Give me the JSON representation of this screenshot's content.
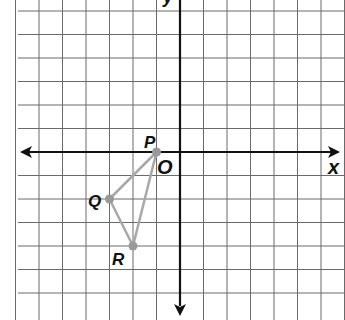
{
  "diagram": {
    "type": "coordinate-plane",
    "axes": {
      "x_label": "x",
      "y_label": "y",
      "origin_label": "O"
    },
    "grid": {
      "unit_px": 23.5,
      "origin_px": [
        180,
        152
      ],
      "x_range": [
        -7,
        7
      ],
      "y_range": [
        -6,
        6
      ]
    },
    "points": [
      {
        "name": "P",
        "x": -1,
        "y": 0
      },
      {
        "name": "Q",
        "x": -3,
        "y": -2
      },
      {
        "name": "R",
        "x": -2,
        "y": -4
      }
    ],
    "polygon": [
      "P",
      "Q",
      "R"
    ],
    "colors": {
      "grid": "#555555",
      "axis": "#111111",
      "triangle": "#a8a8a8",
      "point": "#999999"
    }
  }
}
